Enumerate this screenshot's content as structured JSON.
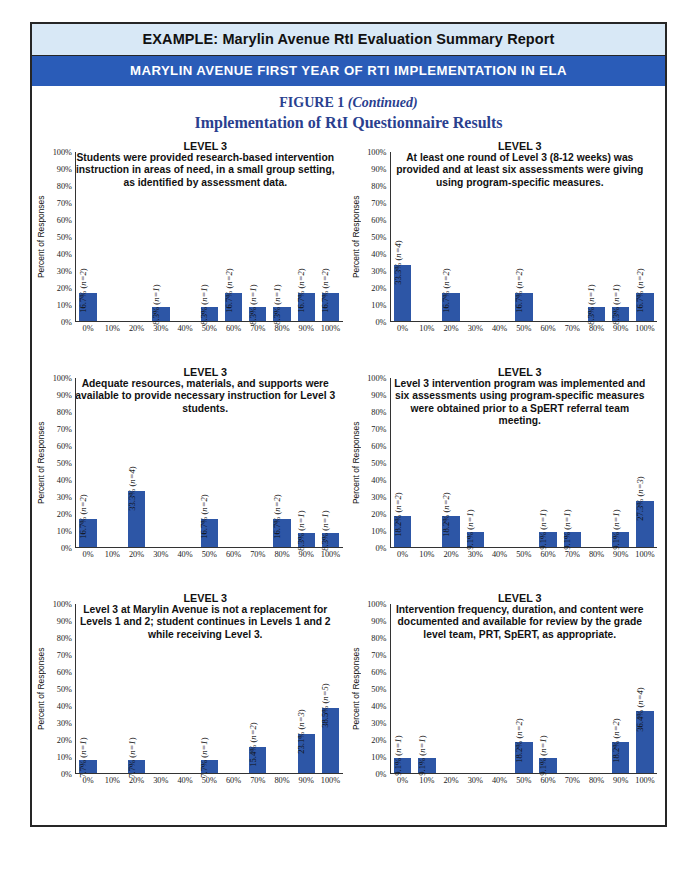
{
  "header": {
    "banner_light": "EXAMPLE: Marylin Avenue RtI Evaluation Summary Report",
    "banner_dark": "MARYLIN AVENUE FIRST YEAR OF RTI IMPLEMENTATION IN ELA",
    "figure_label": "FIGURE 1",
    "figure_continued": "(Continued)",
    "figure_title": "Implementation of RtI Questionnaire Results"
  },
  "colors": {
    "banner_light_bg": "#d8e8f6",
    "banner_dark_bg": "#2a5cb8",
    "heading_text": "#2a3f8f",
    "bar_fill": "#2d56a6",
    "page_border": "#262626"
  },
  "common": {
    "ylabel": "Percent of Responses",
    "yticks": [
      "100%",
      "90%",
      "80%",
      "70%",
      "60%",
      "50%",
      "40%",
      "30%",
      "20%",
      "10%",
      "0%"
    ],
    "categories": [
      "0%",
      "10%",
      "20%",
      "30%",
      "40%",
      "50%",
      "60%",
      "70%",
      "80%",
      "90%",
      "100%"
    ],
    "level_heading": "LEVEL 3"
  },
  "chart_data": [
    {
      "type": "bar",
      "id": "chart-1",
      "title": "LEVEL 3",
      "subtitle": "Students were provided research-based intervention instruction in areas of need, in a small group setting, as identified by assessment data.",
      "xlabel": "",
      "ylabel": "Percent of Responses",
      "ylim": [
        0,
        100
      ],
      "categories": [
        "0%",
        "10%",
        "20%",
        "30%",
        "40%",
        "50%",
        "60%",
        "70%",
        "80%",
        "90%",
        "100%"
      ],
      "values": [
        16.7,
        0,
        0,
        8.3,
        0,
        8.3,
        16.7,
        8.3,
        8.3,
        16.7,
        16.7
      ],
      "counts": [
        2,
        0,
        0,
        1,
        0,
        1,
        2,
        1,
        1,
        2,
        2
      ],
      "labels": [
        "16.7% (n=2)",
        "",
        "",
        "8.3% (n=1)",
        "",
        "8.3% (n=1)",
        "16.7% (n=2)",
        "8.3% (n=1)",
        "8.3% (n=1)",
        "16.7% (n=2)",
        "16.7% (n=2)"
      ]
    },
    {
      "type": "bar",
      "id": "chart-2",
      "title": "LEVEL 3",
      "subtitle": "At least one round of Level 3 (8-12 weeks) was provided and at least six assessments were giving using program-specific measures.",
      "xlabel": "",
      "ylabel": "Percent of Responses",
      "ylim": [
        0,
        100
      ],
      "categories": [
        "0%",
        "10%",
        "20%",
        "30%",
        "40%",
        "50%",
        "60%",
        "70%",
        "80%",
        "90%",
        "100%"
      ],
      "values": [
        33.3,
        0,
        16.7,
        0,
        0,
        16.7,
        0,
        0,
        8.3,
        8.3,
        16.7
      ],
      "counts": [
        4,
        0,
        2,
        0,
        0,
        2,
        0,
        0,
        1,
        1,
        2
      ],
      "labels": [
        "33.3% (n=4)",
        "",
        "16.7% (n=2)",
        "",
        "",
        "16.7% (n=2)",
        "",
        "",
        "8.3% (n=1)",
        "8.3% (n=1)",
        "16.7% (n=2)"
      ]
    },
    {
      "type": "bar",
      "id": "chart-3",
      "title": "LEVEL 3",
      "subtitle": "Adequate resources, materials, and supports were available to provide necessary instruction for Level 3 students.",
      "xlabel": "",
      "ylabel": "Percent of Responses",
      "ylim": [
        0,
        100
      ],
      "categories": [
        "0%",
        "10%",
        "20%",
        "30%",
        "40%",
        "50%",
        "60%",
        "70%",
        "80%",
        "90%",
        "100%"
      ],
      "values": [
        16.7,
        0,
        33.3,
        0,
        0,
        16.7,
        0,
        0,
        16.7,
        8.3,
        8.3
      ],
      "counts": [
        2,
        0,
        4,
        0,
        0,
        2,
        0,
        0,
        2,
        1,
        1
      ],
      "labels": [
        "16.7% (n=2)",
        "",
        "33.3% (n=4)",
        "",
        "",
        "16.7% (n=2)",
        "",
        "",
        "16.7% (n=2)",
        "8.3% (n=1)",
        "8.3% (n=1)"
      ]
    },
    {
      "type": "bar",
      "id": "chart-4",
      "title": "LEVEL 3",
      "subtitle": "Level 3 intervention program was implemented and six assessments using program-specific measures were obtained prior to a SpERT referral team meeting.",
      "xlabel": "",
      "ylabel": "Percent of Responses",
      "ylim": [
        0,
        100
      ],
      "categories": [
        "0%",
        "10%",
        "20%",
        "30%",
        "40%",
        "50%",
        "60%",
        "70%",
        "80%",
        "90%",
        "100%"
      ],
      "values": [
        18.2,
        0,
        18.2,
        9.1,
        0,
        0,
        9.1,
        9.1,
        0,
        9.1,
        27.3
      ],
      "counts": [
        2,
        0,
        2,
        1,
        0,
        0,
        1,
        1,
        0,
        1,
        3
      ],
      "labels": [
        "18.2% (n=2)",
        "",
        "18.2% (n=2)",
        "9.1% (n=1)",
        "",
        "",
        "9.1% (n=1)",
        "9.1% (n=1)",
        "",
        "9.1% (n=1)",
        "27.3% (n=3)"
      ]
    },
    {
      "type": "bar",
      "id": "chart-5",
      "title": "LEVEL 3",
      "subtitle": "Level 3 at Marylin Avenue is not a replacement for Levels 1 and 2; student continues in Levels 1 and 2 while receiving Level 3.",
      "xlabel": "",
      "ylabel": "Percent of Responses",
      "ylim": [
        0,
        100
      ],
      "categories": [
        "0%",
        "10%",
        "20%",
        "30%",
        "40%",
        "50%",
        "60%",
        "70%",
        "80%",
        "90%",
        "100%"
      ],
      "values": [
        7.7,
        0,
        7.7,
        0,
        0,
        7.7,
        0,
        15.4,
        0,
        23.1,
        38.5
      ],
      "counts": [
        1,
        0,
        1,
        0,
        0,
        1,
        0,
        2,
        0,
        3,
        5
      ],
      "labels": [
        "7.7% (n=1)",
        "",
        "7.7% (n=1)",
        "",
        "",
        "7.7% (n=1)",
        "",
        "15.4% (n=2)",
        "",
        "23.1% (n=3)",
        "38.5% (n=5)"
      ]
    },
    {
      "type": "bar",
      "id": "chart-6",
      "title": "LEVEL 3",
      "subtitle": "Intervention frequency, duration, and content were documented and available for review by the grade level team, PRT, SpERT, as appropriate.",
      "xlabel": "",
      "ylabel": "Percent of Responses",
      "ylim": [
        0,
        100
      ],
      "categories": [
        "0%",
        "10%",
        "20%",
        "30%",
        "40%",
        "50%",
        "60%",
        "70%",
        "80%",
        "90%",
        "100%"
      ],
      "values": [
        9.1,
        9.1,
        0,
        0,
        0,
        18.2,
        9.1,
        0,
        0,
        18.2,
        36.4
      ],
      "counts": [
        1,
        1,
        0,
        0,
        0,
        2,
        1,
        0,
        0,
        2,
        4
      ],
      "labels": [
        "9.1% (n=1)",
        "9.1% (n=1)",
        "",
        "",
        "",
        "18.2% (n=2)",
        "9.1% (n=1)",
        "",
        "",
        "18.2% (n=2)",
        "36.4% (n=4)"
      ]
    }
  ]
}
